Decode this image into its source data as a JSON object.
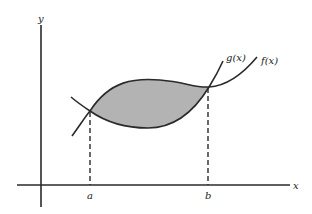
{
  "diagram": {
    "axes": {
      "x_label": "x",
      "y_label": "y"
    },
    "curves": [
      {
        "name": "g",
        "label": "g(x)"
      },
      {
        "name": "f",
        "label": "f(x)"
      }
    ],
    "bounds": {
      "a_label": "a",
      "b_label": "b"
    },
    "colors": {
      "stroke": "#2a2a2a",
      "shade": "#b3b3b3",
      "background": "#ffffff"
    }
  }
}
